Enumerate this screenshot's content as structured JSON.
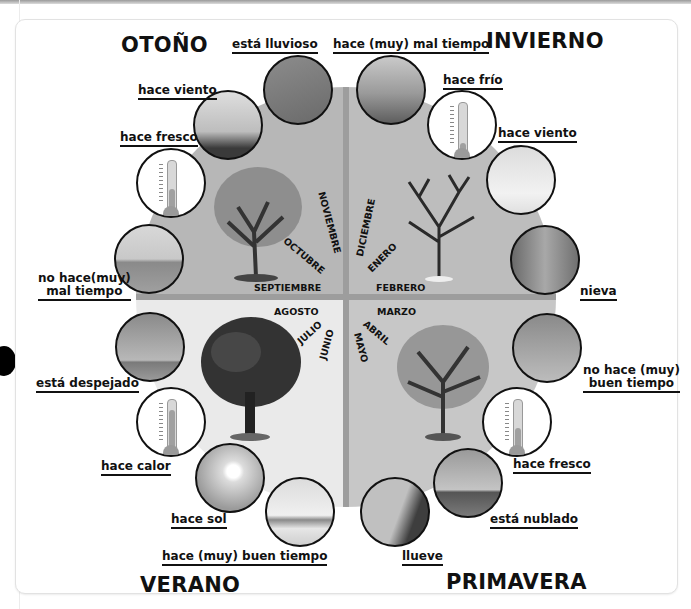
{
  "seasons": {
    "autumn": "OTOÑO",
    "winter": "INVIERNO",
    "summer": "VERANO",
    "spring": "PRIMAVERA"
  },
  "months": {
    "autumn": [
      "SEPTIEMBRE",
      "OCTUBRE",
      "NOVIEMBRE"
    ],
    "winter": [
      "DICIEMBRE",
      "ENERO",
      "FEBRERO"
    ],
    "spring": [
      "MARZO",
      "ABRIL",
      "MAYO"
    ],
    "summer": [
      "JUNIO",
      "JULIO",
      "AGOSTO"
    ]
  },
  "weather_labels": {
    "esta_lluvioso": "está lluvioso",
    "mal_tiempo": "hace (muy) mal tiempo",
    "hace_frio": "hace frío",
    "hace_viento_invierno": "hace viento",
    "nieva": "nieva",
    "no_buen_tiempo_1": "no hace (muy)",
    "no_buen_tiempo_2": "buen tiempo",
    "hace_fresco_primavera": "hace fresco",
    "esta_nublado": "está nublado",
    "llueve": "llueve",
    "buen_tiempo": "hace (muy) buen tiempo",
    "hace_sol": "hace sol",
    "hace_calor": "hace calor",
    "esta_despejado": "está despejado",
    "no_mal_tiempo_1": "no hace(muy)",
    "no_mal_tiempo_2": "mal tiempo",
    "hace_fresco_otono": "hace fresco",
    "hace_viento_otono": "hace viento"
  },
  "colors": {
    "autumn_quadrant": "#b7b7b7",
    "winter_quadrant": "#bdbdbd",
    "summer_quadrant": "#eaeaea",
    "spring_quadrant": "#c7c7c7",
    "divider": "#9d9d9d"
  }
}
